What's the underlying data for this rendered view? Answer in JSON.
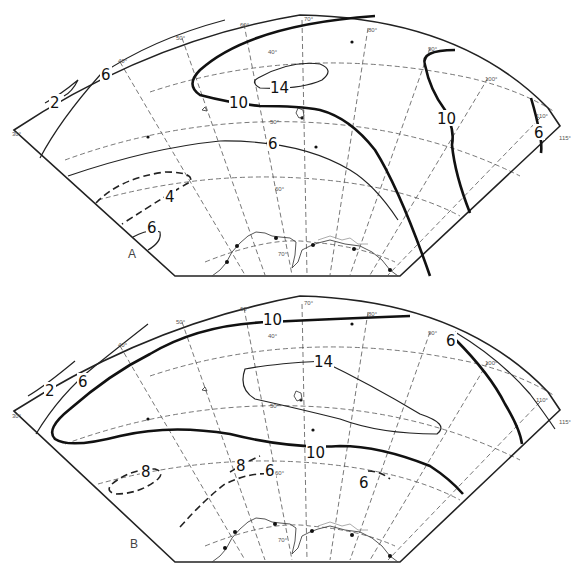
{
  "panels": [
    {
      "id": "A",
      "label": "A",
      "isolines": [
        {
          "value": "2",
          "style": "thin"
        },
        {
          "value": "6",
          "style": "thin"
        },
        {
          "value": "10",
          "style": "thick"
        },
        {
          "value": "14",
          "style": "thin"
        },
        {
          "value": "10",
          "style": "thick"
        },
        {
          "value": "6",
          "style": "thick"
        },
        {
          "value": "6",
          "style": "thin"
        },
        {
          "value": "4",
          "style": "dashed"
        },
        {
          "value": "6",
          "style": "thin"
        }
      ],
      "longitude_labels": [
        "40°",
        "50°",
        "60°",
        "70°",
        "80°",
        "90°",
        "100°",
        "110°",
        "115°",
        "30°"
      ],
      "latitude_labels": [
        "40°",
        "50°",
        "60°",
        "70°"
      ]
    },
    {
      "id": "B",
      "label": "B",
      "isolines": [
        {
          "value": "2",
          "style": "thin"
        },
        {
          "value": "6",
          "style": "thin"
        },
        {
          "value": "10",
          "style": "thick"
        },
        {
          "value": "14",
          "style": "thin"
        },
        {
          "value": "10",
          "style": "thick"
        },
        {
          "value": "6",
          "style": "thin"
        },
        {
          "value": "8",
          "style": "dashed"
        },
        {
          "value": "8",
          "style": "dashed"
        },
        {
          "value": "6",
          "style": "dashed"
        },
        {
          "value": "6",
          "style": "dashed"
        }
      ],
      "longitude_labels": [
        "40°",
        "50°",
        "60°",
        "70°",
        "80°",
        "90°",
        "100°",
        "110°",
        "115°",
        "30°"
      ],
      "latitude_labels": [
        "40°",
        "50°",
        "60°",
        "70°"
      ]
    }
  ],
  "labels": {
    "a": {
      "panel": "A",
      "iso_2": "2",
      "iso_6_nw": "6",
      "iso_10_w": "10",
      "iso_14": "14",
      "iso_10_e": "10",
      "iso_6_e": "6",
      "iso_6_mid": "6",
      "iso_4": "4",
      "iso_6_sw": "6",
      "lon_40": "40°",
      "lon_50": "50°",
      "lon_60": "60°",
      "lon_70": "70°",
      "lon_80": "80°",
      "lon_90": "90°",
      "lon_100": "100°",
      "lon_110": "110°",
      "lon_115": "115°",
      "lon_30": "30°",
      "lat_40": "40°",
      "lat_50": "50°",
      "lat_60": "60°",
      "lat_70": "70°"
    },
    "b": {
      "panel": "B",
      "iso_2": "2",
      "iso_6_nw": "6",
      "iso_10_n": "10",
      "iso_14": "14",
      "iso_10_s": "10",
      "iso_6_ne": "6",
      "iso_8_w": "8",
      "iso_8_mid": "8",
      "iso_6_mid": "6",
      "iso_6_se": "6",
      "lon_40": "40°",
      "lon_50": "50°",
      "lon_60": "60°",
      "lon_70": "70°",
      "lon_80": "80°",
      "lon_90": "90°",
      "lon_100": "100°",
      "lon_110": "110°",
      "lon_115": "115°",
      "lon_30": "30°",
      "lat_40": "40°",
      "lat_50": "50°",
      "lat_60": "60°",
      "lat_70": "70°"
    }
  }
}
